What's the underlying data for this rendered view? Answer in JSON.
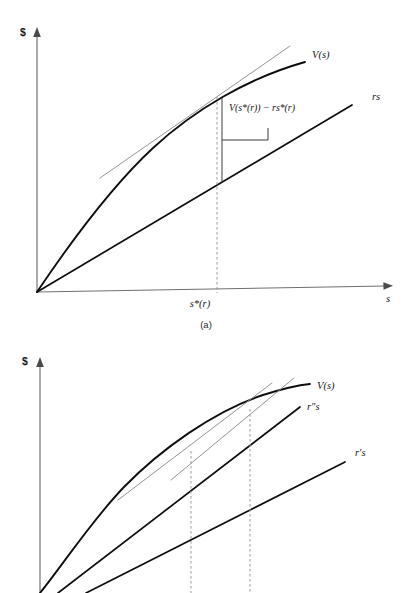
{
  "document": {
    "kind": "textbook-figure",
    "background_color": "#ffffff",
    "ink_color": "#0d0d0d",
    "tangent_color": "#8d8d8d",
    "axis_color": "#6f6f6f",
    "dashed_color": "#9a9a9a"
  },
  "figures": [
    {
      "id": "figure-a",
      "caption": "(a)",
      "axes": {
        "y_label": "$",
        "x_label": "s",
        "origin": {
          "x": 37,
          "y": 292
        },
        "y_top": {
          "x": 37,
          "y": 32
        },
        "x_right": {
          "x": 392,
          "y": 285
        }
      },
      "x_ticks": [
        {
          "label": "s*(r)",
          "x": 217,
          "y": 305
        }
      ],
      "series": [
        {
          "name": "value-curve",
          "label": "V(s)",
          "label_pos": {
            "x": 312,
            "y": 58
          },
          "style": "concave-curve",
          "description": "Concave increasing value function V(s) rising from the origin and flattening to the right."
        },
        {
          "name": "cost-line",
          "label": "rs",
          "label_pos": {
            "x": 372,
            "y": 100
          },
          "style": "straight-line",
          "description": "Straight ray rs from the origin with slope r."
        },
        {
          "name": "tangent",
          "label": "",
          "style": "tangent",
          "description": "Thin gray tangent to V(s) at s*(r), parallel to the rs line."
        }
      ],
      "annotations": [
        {
          "name": "surplus-bracket",
          "text": "V(s*(r)) − rs*(r)",
          "text_pos": {
            "x": 229,
            "y": 111
          },
          "description": "Vertical gap between the value curve and the rs line at s*(r)."
        }
      ],
      "guides": [
        {
          "name": "dashed-drop-sstar",
          "x": 217,
          "y_top": 97,
          "y_bottom": 292
        }
      ]
    },
    {
      "id": "figure-b",
      "caption": "",
      "axes": {
        "y_label": "$",
        "x_label": "",
        "origin": {
          "x": 40,
          "y": 600
        },
        "y_top": {
          "x": 40,
          "y": 362
        }
      },
      "x_ticks": [],
      "series": [
        {
          "name": "value-curve",
          "label": "V(s)",
          "label_pos": {
            "x": 317,
            "y": 389
          },
          "style": "concave-curve",
          "description": "Concave increasing value function V(s)."
        },
        {
          "name": "cost-line-high",
          "label": "r″s",
          "label_pos": {
            "x": 307,
            "y": 410
          },
          "style": "straight-line",
          "description": "Steeper ray r″s from the origin."
        },
        {
          "name": "cost-line-low",
          "label": "r′s",
          "label_pos": {
            "x": 355,
            "y": 456
          },
          "style": "straight-line",
          "description": "Flatter ray r′s from the origin."
        },
        {
          "name": "tangent-high",
          "label": "",
          "style": "tangent",
          "description": "Thin gray tangent to V(s) parallel to r″s."
        },
        {
          "name": "tangent-low",
          "label": "",
          "style": "tangent",
          "description": "Thin gray tangent to V(s) parallel to r′s."
        }
      ],
      "annotations": [],
      "guides": [
        {
          "name": "dashed-drop-left",
          "x": 191,
          "y_top": 451,
          "y_bottom": 593
        },
        {
          "name": "dashed-drop-right",
          "x": 250,
          "y_top": 409,
          "y_bottom": 593
        }
      ]
    }
  ]
}
